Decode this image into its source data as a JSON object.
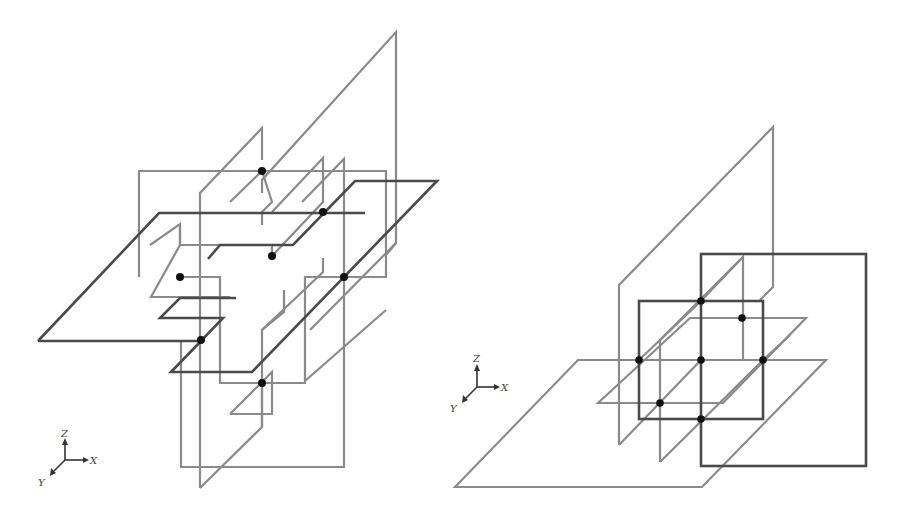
{
  "figure": {
    "left_panel": {
      "description": "Arrangement of planes in 3D with intersection points (left configuration)",
      "axes": {
        "z_label": "Z",
        "x_label": "X",
        "y_label": "Y"
      },
      "intersection_point_count": 7
    },
    "right_panel": {
      "description": "Arrangement of planes in 3D with intersection points (right configuration)",
      "axes": {
        "z_label": "Z",
        "x_label": "X",
        "y_label": "Y"
      },
      "intersection_point_count": 7
    },
    "colors": {
      "plane_gray": "#8a8a8a",
      "plane_dark": "#4a4a4a",
      "point": "#111111",
      "background": "#ffffff"
    }
  }
}
